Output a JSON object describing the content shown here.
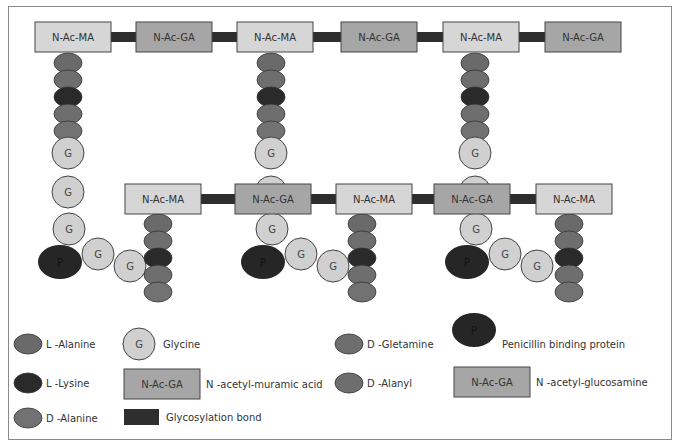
{
  "colors": {
    "ma_box": "#d6d6d6",
    "ga_box": "#a6a6a6",
    "bond": "#2e2e2e",
    "l_alanine": "#6a6a6a",
    "d_gletamine": "#6e6e6e",
    "l_lysine": "#2a2a2a",
    "d_alanyl": "#6e6e6e",
    "d_alanine": "#727272",
    "glycine": "#d0d0d0",
    "pbp": "#262626",
    "outline": "#444444"
  },
  "diagram": {
    "ma_label": "N-Ac-MA",
    "ga_label": "N-Ac-GA",
    "glycine_label": "G",
    "pbp_label": "P",
    "top_chain": [
      "N-Ac-MA",
      "N-Ac-GA",
      "N-Ac-MA",
      "N-Ac-GA",
      "N-Ac-MA",
      "N-Ac-GA"
    ],
    "bottom_chain": [
      "N-Ac-MA",
      "N-Ac-GA",
      "N-Ac-MA",
      "N-Ac-GA",
      "N-Ac-MA"
    ]
  },
  "legend": {
    "l_alanine": "L -Alanine",
    "l_lysine": "L -Lysine",
    "d_alanine": "D -Alanine",
    "glycine_symbol": "G",
    "glycine": "Glycine",
    "ma_symbol": "N-Ac-GA",
    "ma": "N -acetyl-muramic acid",
    "bond": "Glycosylation bond",
    "d_gletamine": "D -Gletamine",
    "d_alanyl": "D -Alanyl",
    "pbp_symbol": "P",
    "pbp": "Penicillin binding protein",
    "ga_symbol": "N-Ac-GA",
    "ga": "N -acetyl-glucosamine"
  }
}
